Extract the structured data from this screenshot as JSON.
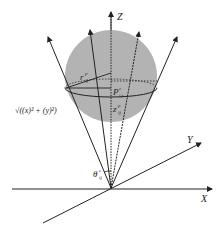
{
  "diagram": {
    "type": "3d-coordinate-sphere-ray-diagram",
    "axes": {
      "x_label": "X",
      "y_label": "Y",
      "z_label": "Z"
    },
    "labels": {
      "radius": "r",
      "radius_sup": "p",
      "radius_sub": "ij",
      "point": "P",
      "point_sup": "c",
      "point_sub": "i,t",
      "height": "z",
      "height_sup": "p",
      "height_sub": "ij",
      "distance_expr": "√((x)² + (y)²)",
      "angle": "θ",
      "angle_sup": "c",
      "angle_sub": "ij"
    },
    "colors": {
      "sphere_fill": "#b3b3b3",
      "line": "#222222",
      "background": "#ffffff"
    }
  }
}
